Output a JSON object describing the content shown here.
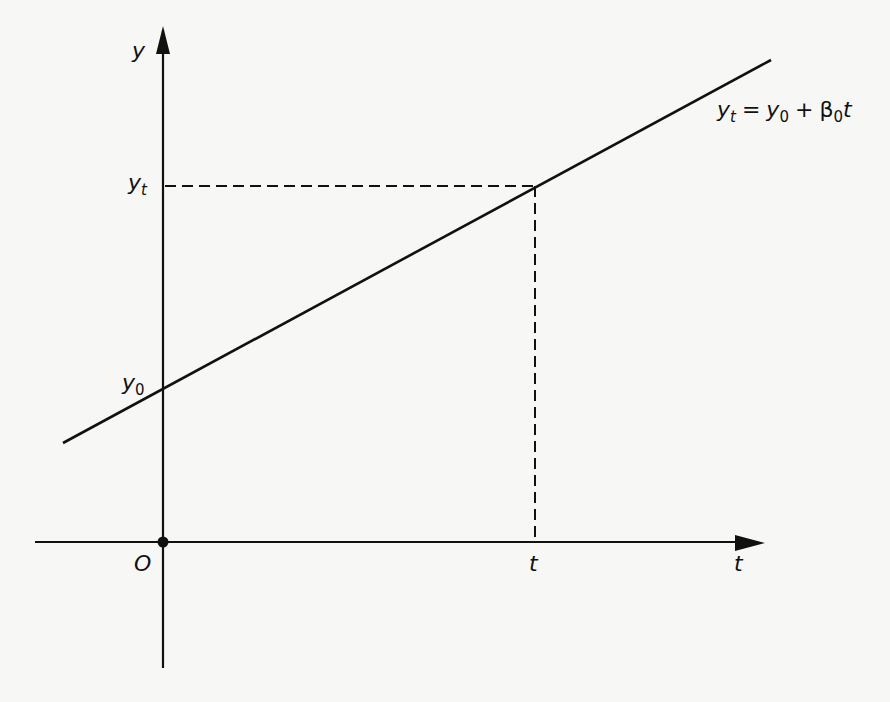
{
  "figure": {
    "type": "linear-growth-diagram",
    "axes": {
      "y_axis_label": "y",
      "x_axis_label": "t",
      "origin_label": "O"
    },
    "annotations": {
      "yt_label_main": "y",
      "yt_label_sub": "t",
      "y0_label_main": "y",
      "y0_label_sub": "0",
      "t_marker_label": "t"
    },
    "equation": {
      "lhs_main": "y",
      "lhs_sub": "t",
      "equals": "=",
      "term1_main": "y",
      "term1_sub": "0",
      "plus": "+",
      "beta": "β",
      "beta_sub": "0",
      "var": "t"
    },
    "colors": {
      "ink": "#111111",
      "paper": "#f7f7f5"
    }
  }
}
